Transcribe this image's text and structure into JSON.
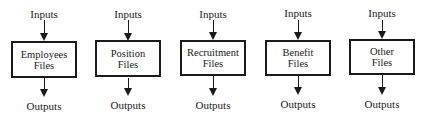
{
  "diagram": {
    "type": "flow",
    "units": [
      {
        "line1": "Employees",
        "line2": "Files",
        "input": "Inputs",
        "output": "Outputs"
      },
      {
        "line1": "Position",
        "line2": "Files",
        "input": "Inputs",
        "output": "Outputs"
      },
      {
        "line1": "Recruitment",
        "line2": "Files",
        "input": "Inputs",
        "output": "Outputs"
      },
      {
        "line1": "Benefit",
        "line2": "Files",
        "input": "Inputs",
        "output": "Outputs"
      },
      {
        "line1": "Other",
        "line2": "Files",
        "input": "Inputs",
        "output": "Outputs"
      }
    ]
  }
}
